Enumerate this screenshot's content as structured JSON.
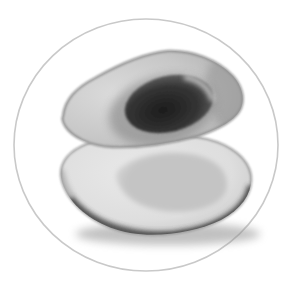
{
  "photo": {
    "alt": "Grayscale photograph of an avocado sliced in half inside a thin circular frame; the upper half holds the dark pit, the lower half shows the empty seed cavity",
    "background": "#ffffff",
    "frame_color": "#c9c9c9",
    "colors": {
      "flesh_top_light": "#dbdbdb",
      "flesh_top_mid": "#c7c7c7",
      "flesh_top_dark": "#a9a9a9",
      "flesh_bottom_light": "#e9e9e9",
      "flesh_bottom_mid": "#dedede",
      "flesh_bottom_dark": "#bdbdbd",
      "cavity_center": "#c4c4c4",
      "cavity_edge": "#e0e0e0",
      "pit_core": "#1c1c1c",
      "pit_mid": "#343434",
      "pit_edge": "#757575",
      "pit_halo": "#8a8a8a",
      "pit_highlight": "#d6d6d6",
      "skin_dark": "#3c3c3c",
      "skin_soft": "#8f8f8f",
      "shadow": "#8e8e8e"
    }
  }
}
